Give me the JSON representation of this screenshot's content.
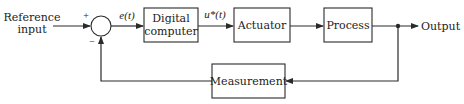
{
  "diagram": {
    "type": "feedback-control-block-diagram",
    "input": {
      "label_line1": "Reference",
      "label_line2": "input"
    },
    "summing_junction": {
      "plus_sign": "+",
      "minus_sign": "−"
    },
    "signals": {
      "error": "e(t)",
      "control": "u*(t)"
    },
    "blocks": {
      "digital_computer": {
        "line1": "Digital",
        "line2": "computer"
      },
      "actuator": {
        "label": "Actuator"
      },
      "process": {
        "label": "Process"
      },
      "measurement": {
        "label": "Measurement"
      }
    },
    "output": {
      "label": "Output"
    },
    "colors": {
      "line": "#2a2a2a",
      "background": "#ffffff"
    }
  }
}
